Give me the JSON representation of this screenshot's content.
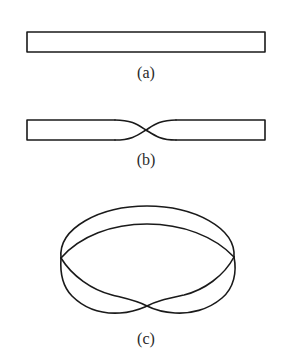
{
  "figure": {
    "stroke_color": "#1a1a1a",
    "background_color": "#ffffff",
    "panels": [
      {
        "id": "a",
        "label": "(a)",
        "caption": "flat rectangular strip"
      },
      {
        "id": "b",
        "label": "(b)",
        "caption": "strip with a half twist in the middle"
      },
      {
        "id": "c",
        "label": "(c)",
        "caption": "ends joined to form a Mobius strip"
      }
    ]
  }
}
